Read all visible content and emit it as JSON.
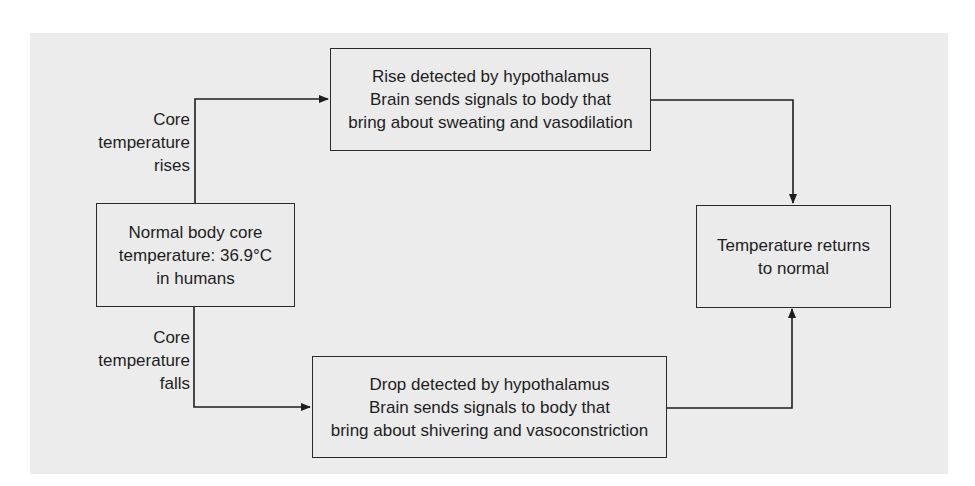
{
  "diagram": {
    "title": "",
    "nodes": {
      "normal": {
        "lines": [
          "Normal body core",
          "temperature: 36.9°C",
          "in humans"
        ]
      },
      "rise": {
        "lines": [
          "Rise detected by hypothalamus",
          "Brain sends signals to body that",
          "bring about sweating and vasodilation"
        ]
      },
      "drop": {
        "lines": [
          "Drop detected by hypothalamus",
          "Brain sends signals to body that",
          "bring about shivering and vasoconstriction"
        ]
      },
      "returns": {
        "lines": [
          "Temperature returns",
          "to normal"
        ]
      }
    },
    "edge_labels": {
      "rises": {
        "lines": [
          "Core",
          "temperature",
          "rises"
        ]
      },
      "falls": {
        "lines": [
          "Core",
          "temperature",
          "falls"
        ]
      }
    },
    "edges": [
      {
        "from": "normal",
        "to": "rise",
        "label": "Core temperature rises"
      },
      {
        "from": "normal",
        "to": "drop",
        "label": "Core temperature falls"
      },
      {
        "from": "rise",
        "to": "returns",
        "label": ""
      },
      {
        "from": "drop",
        "to": "returns",
        "label": ""
      }
    ],
    "colors": {
      "background": "#ececec",
      "stroke": "#2a2a2a",
      "text": "#1e1e1e"
    }
  }
}
